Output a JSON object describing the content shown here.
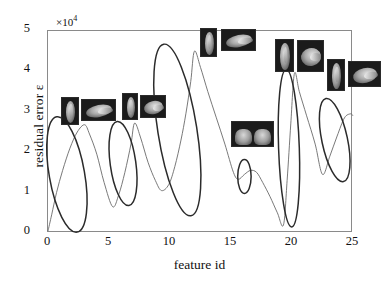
{
  "figure": {
    "exponent_label": "×10",
    "exponent_power": "4",
    "ylabel": "residual error ε",
    "xlabel": "feature id",
    "line_color": "#6a6a6a",
    "ellipse_color": "#2b2b2b",
    "axis_color": "#8a8a8a"
  },
  "chart_data": {
    "type": "line",
    "title": "",
    "xlabel": "feature id",
    "ylabel": "residual error ε",
    "y_scale_note": "×10^4",
    "xlim": [
      0,
      25
    ],
    "ylim": [
      0,
      5
    ],
    "xticks": [
      0,
      5,
      10,
      15,
      20,
      25
    ],
    "yticks": [
      0,
      1,
      2,
      3,
      4,
      5
    ],
    "grid": false,
    "legend": "none",
    "series": [
      {
        "name": "residual error",
        "x": [
          0.0,
          0.3,
          0.7,
          1.2,
          1.8,
          2.4,
          3.0,
          3.4,
          4.0,
          4.6,
          5.3,
          5.8,
          6.3,
          6.8,
          7.1,
          7.6,
          8.2,
          8.8,
          9.3,
          9.9,
          10.4,
          10.9,
          11.3,
          11.7,
          12.0,
          12.5,
          13.1,
          13.8,
          14.5,
          15.2,
          15.6,
          16.1,
          16.6,
          17.1,
          17.6,
          18.2,
          18.8,
          19.3,
          19.6,
          19.9,
          20.2,
          20.6,
          21.2,
          21.9,
          22.5,
          23.1,
          23.7,
          24.3,
          24.8,
          25.0
        ],
        "y": [
          0.05,
          0.45,
          1.0,
          1.55,
          2.1,
          2.5,
          2.68,
          2.45,
          1.95,
          1.25,
          0.65,
          0.95,
          1.5,
          2.2,
          2.72,
          2.35,
          1.75,
          1.3,
          1.05,
          1.2,
          1.65,
          2.3,
          2.95,
          3.75,
          4.5,
          4.1,
          3.5,
          2.85,
          2.2,
          1.5,
          1.33,
          1.45,
          1.55,
          1.5,
          1.25,
          0.9,
          0.5,
          0.2,
          1.3,
          2.7,
          3.95,
          3.5,
          2.9,
          2.2,
          1.45,
          1.9,
          2.4,
          2.85,
          2.95,
          2.9
        ]
      }
    ],
    "highlight_ellipses": [
      {
        "cx": 1.55,
        "cy": 1.45,
        "rx": 1.45,
        "ry": 1.45,
        "rot": -10,
        "label": "peak-1"
      },
      {
        "cx": 6.15,
        "cy": 1.72,
        "rx": 1.05,
        "ry": 1.05,
        "rot": -8,
        "label": "peak-2"
      },
      {
        "cx": 10.6,
        "cy": 2.55,
        "rx": 1.6,
        "ry": 2.15,
        "rot": -9,
        "label": "peak-3"
      },
      {
        "cx": 16.1,
        "cy": 1.4,
        "rx": 0.55,
        "ry": 0.42,
        "rot": 0,
        "label": "valley-4"
      },
      {
        "cx": 19.75,
        "cy": 2.1,
        "rx": 0.85,
        "ry": 1.95,
        "rot": -2,
        "label": "peak-5"
      },
      {
        "cx": 23.5,
        "cy": 2.3,
        "rx": 1.05,
        "ry": 1.05,
        "rot": -12,
        "label": "peak-6"
      }
    ],
    "annotations": [
      {
        "label": "hand-thumbnail-pair-1",
        "at_x": 3.0,
        "at_y": 2.7
      },
      {
        "label": "hand-thumbnail-pair-2",
        "at_x": 7.1,
        "at_y": 2.72
      },
      {
        "label": "hand-thumbnail-pair-3",
        "at_x": 12.0,
        "at_y": 4.5
      },
      {
        "label": "hand-thumbnail-single-4",
        "at_x": 16.1,
        "at_y": 1.4
      },
      {
        "label": "hand-thumbnail-pair-5",
        "at_x": 20.2,
        "at_y": 3.95
      },
      {
        "label": "hand-thumbnail-pair-6",
        "at_x": 24.5,
        "at_y": 2.95
      }
    ]
  },
  "axis": {
    "y_tick_labels": [
      "5",
      "4",
      "3",
      "2",
      "1",
      "0"
    ],
    "x_tick_labels": [
      "0",
      "5",
      "10",
      "15",
      "20",
      "25"
    ]
  },
  "thumbnails": [
    {
      "name": "thumb-1a",
      "left": 61,
      "top": 97,
      "w": 18,
      "h": 28,
      "kind": "narrow-finger"
    },
    {
      "name": "thumb-1b",
      "left": 81,
      "top": 99,
      "w": 35,
      "h": 22,
      "kind": "wide-hand"
    },
    {
      "name": "thumb-2a",
      "left": 122,
      "top": 93,
      "w": 16,
      "h": 27,
      "kind": "narrow-finger"
    },
    {
      "name": "thumb-2b",
      "left": 140,
      "top": 95,
      "w": 26,
      "h": 23,
      "kind": "wide-hand"
    },
    {
      "name": "thumb-3a",
      "left": 200,
      "top": 28,
      "w": 17,
      "h": 29,
      "kind": "narrow-finger"
    },
    {
      "name": "thumb-3b",
      "left": 221,
      "top": 29,
      "w": 35,
      "h": 22,
      "kind": "wide-hand"
    },
    {
      "name": "thumb-4",
      "left": 231,
      "top": 121,
      "w": 43,
      "h": 26,
      "kind": "two-hands"
    },
    {
      "name": "thumb-5a",
      "left": 275,
      "top": 39,
      "w": 19,
      "h": 33,
      "kind": "narrow-finger"
    },
    {
      "name": "thumb-5b",
      "left": 297,
      "top": 40,
      "w": 27,
      "h": 32,
      "kind": "wide-hand"
    },
    {
      "name": "thumb-6a",
      "left": 327,
      "top": 59,
      "w": 18,
      "h": 32,
      "kind": "narrow-finger"
    },
    {
      "name": "thumb-6b",
      "left": 348,
      "top": 61,
      "w": 33,
      "h": 26,
      "kind": "wide-hand"
    }
  ]
}
